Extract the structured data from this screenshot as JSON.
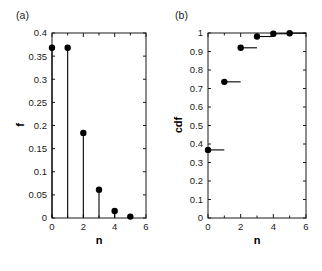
{
  "figure": {
    "panels": [
      {
        "key": "a",
        "tag": "(a)",
        "ylabel": "f",
        "xlabel": "n"
      },
      {
        "key": "b",
        "tag": "(b)",
        "ylabel": "cdf",
        "xlabel": "n"
      }
    ],
    "colors": {
      "axis": "#1a1a1a",
      "marker": "#000000",
      "line": "#000000",
      "background": "#ffffff"
    }
  },
  "chart_data": [
    {
      "type": "scatter",
      "panel": "(a)",
      "title": "",
      "xlabel": "n",
      "ylabel": "f",
      "xlim": [
        0,
        6
      ],
      "ylim": [
        0,
        0.4
      ],
      "xticks": [
        0,
        2,
        4,
        6
      ],
      "xticklabels": [
        "0",
        "2",
        "4",
        "6"
      ],
      "xminorticks": [
        1,
        3,
        5
      ],
      "yticks": [
        0,
        0.05,
        0.1,
        0.15,
        0.2,
        0.25,
        0.3,
        0.35,
        0.4
      ],
      "yticklabels": [
        "0",
        "0.05",
        "0.1",
        "0.15",
        "0.2",
        "0.25",
        "0.3",
        "0.35",
        "0.4"
      ],
      "grid": false,
      "legend": null,
      "style": "stem",
      "x": [
        0,
        1,
        2,
        3,
        4,
        5
      ],
      "values": [
        0.368,
        0.368,
        0.184,
        0.061,
        0.015,
        0.003
      ]
    },
    {
      "type": "scatter",
      "panel": "(b)",
      "title": "",
      "xlabel": "n",
      "ylabel": "cdf",
      "xlim": [
        0,
        6
      ],
      "ylim": [
        0,
        1
      ],
      "xticks": [
        0,
        2,
        4,
        6
      ],
      "xticklabels": [
        "0",
        "2",
        "4",
        "6"
      ],
      "xminorticks": [
        1,
        3,
        5
      ],
      "yticks": [
        0,
        0.1,
        0.2,
        0.3,
        0.4,
        0.5,
        0.6,
        0.7,
        0.8,
        0.9,
        1
      ],
      "yticklabels": [
        "0",
        "0.1",
        "0.2",
        "0.3",
        "0.4",
        "0.5",
        "0.6",
        "0.7",
        "0.8",
        "0.9",
        "1"
      ],
      "grid": false,
      "legend": null,
      "style": "step-with-markers",
      "x": [
        0,
        1,
        2,
        3,
        4,
        5
      ],
      "values": [
        0.368,
        0.736,
        0.92,
        0.981,
        0.996,
        0.999
      ]
    }
  ]
}
